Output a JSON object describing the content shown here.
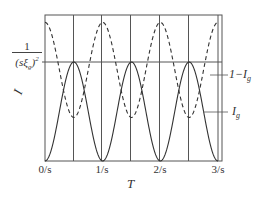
{
  "chart_data": {
    "type": "line",
    "title": "",
    "xlabel": "T",
    "ylabel": "I",
    "y_reference_label": "1/(sξ_g)^2",
    "x_ticks": [
      "0/s",
      "1/s",
      "2/s",
      "3/s"
    ],
    "x_range": [
      0,
      3
    ],
    "grid": true,
    "series": [
      {
        "name": "I_g",
        "style": "solid",
        "description": "periodic curve, zero at integer multiples of 1/s, peak reaching 1/(sξ_g)^2 at half-integer multiples",
        "x": [
          0,
          0.5,
          1,
          1.5,
          2,
          2.5,
          3
        ],
        "y_relative": [
          0,
          1,
          0,
          1,
          0,
          1,
          0
        ]
      },
      {
        "name": "1-I_g",
        "style": "dashed",
        "description": "complementary curve, maxima at integer multiples, minima at half-integer multiples",
        "x": [
          0,
          0.5,
          1,
          1.5,
          2,
          2.5,
          3
        ],
        "y_relative": [
          1.4,
          0.44,
          1.4,
          0.44,
          1.4,
          0.44,
          1.4
        ]
      }
    ],
    "annotations": [
      "1-I_g",
      "I_g"
    ]
  },
  "labels": {
    "y_axis": "I",
    "y_ref_num": "1",
    "y_ref_den": "(sξ",
    "y_ref_sub": "g",
    "y_ref_close": ")",
    "y_ref_exp": "2",
    "x_axis": "T",
    "ann_dashed_prefix": "1−I",
    "ann_dashed_sub": "g",
    "ann_solid": "I",
    "ann_solid_sub": "g",
    "tick_0": "0/s",
    "tick_1": "1/s",
    "tick_2": "2/s",
    "tick_3": "3/s"
  }
}
